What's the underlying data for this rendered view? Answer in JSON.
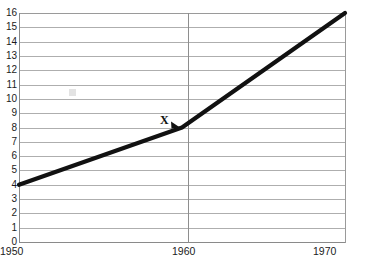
{
  "chart_data": {
    "type": "line",
    "title": "",
    "subtitle": "",
    "xlabel": "",
    "ylabel": "",
    "x": [
      1950,
      1960,
      1970
    ],
    "xtick_labels": [
      "1950",
      "1960",
      "1970"
    ],
    "ytick_labels": [
      "0",
      "1",
      "2",
      "3",
      "4",
      "5",
      "6",
      "7",
      "8",
      "9",
      "10",
      "11",
      "12",
      "13",
      "14",
      "15",
      "16"
    ],
    "series": [
      {
        "name": "",
        "values": [
          4,
          8,
          16
        ]
      }
    ],
    "xlim": [
      1950,
      1970
    ],
    "ylim": [
      0,
      16
    ],
    "ytick_step": 1,
    "grid": "horizontal-and-vertical-at-1960",
    "legend": "none",
    "annotations": [
      {
        "label": "X",
        "x": 1960,
        "y": 8,
        "marker": "arrowhead-pointing-down-right"
      }
    ],
    "colors": {
      "line": "#111111",
      "grid": "#aeaeae",
      "axis": "#8a8a8a",
      "background": "#ffffff",
      "text": "#1b1b1b"
    }
  },
  "icons": {
    "annotation_arrow": "arrow-marker-icon",
    "smudge": "scan-artifact-icon"
  }
}
